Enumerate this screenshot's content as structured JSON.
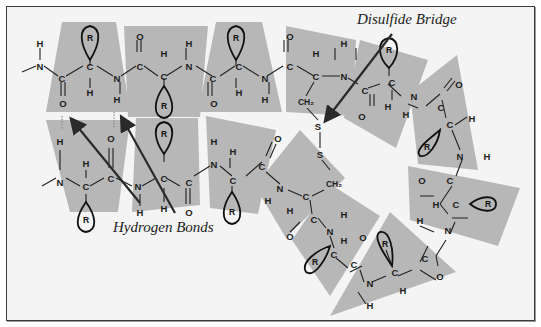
{
  "diagram": {
    "colors": {
      "background": "#f4f4f4",
      "plane_fill": "#b7b7b7",
      "ink": "#1e1e1e",
      "frame_border": "#3a3a3a"
    },
    "labels": {
      "disulfide": "Disulfide Bridge",
      "hydrogen": "Hydrogen Bonds"
    },
    "atom_symbols": {
      "N": "N",
      "C": "C",
      "O": "O",
      "H": "H",
      "S": "S",
      "CH2": "CH₂",
      "R": "R"
    },
    "top_strand": {
      "description": "Upper row: -N(H)-C(=O)-C(H)(R)-N(H)-C(=O)-C(H)(R)-N(H)-C(=O)-C(H)(R)-N(H)-C(=O)-C(H)(CH2-S)-N(H)-C(=O)-C(H)(R)-N(H)-...",
      "residues": 5
    },
    "bottom_strand": {
      "description": "Lower row: -N(H)-C(H)(R)-C(=O)-N(H)-C(H)(R)-C(=O)-N(H)-C(H)(R)-C(=O)-N(H)-C(H)(CH2-S)-C(=O)-N(H)-...",
      "residues": 4
    },
    "bonds": {
      "hydrogen_bonds": 2,
      "disulfide_bridges": 1,
      "r_groups": 11
    }
  }
}
